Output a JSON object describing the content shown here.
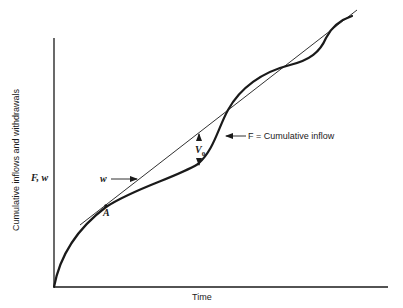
{
  "figure": {
    "y_axis_label": "Cumulative inflows and withdrawals",
    "y_axis_symbol": "F, w",
    "x_axis_label": "Time",
    "point_label": "A",
    "line_label": "w",
    "curve_label": "F = Cumulative inflow",
    "gap_label_main": "V",
    "gap_label_sub": "0"
  },
  "colors": {
    "ink": "#1a1a1a",
    "background": "#ffffff"
  }
}
